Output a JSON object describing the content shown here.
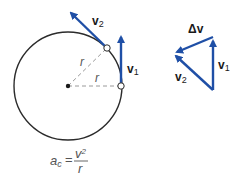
{
  "diagram": {
    "colors": {
      "vector": "#1f4fa6",
      "circle": "#2b2b2b",
      "radius_dash": "#9a9a9a",
      "label": "#1a1a1a",
      "formula": "#555555"
    },
    "circle": {
      "center": [
        68,
        86
      ],
      "radius": 54
    },
    "points": [
      {
        "name": "point-1",
        "pos": [
          121,
          86
        ]
      },
      {
        "name": "point-2",
        "pos": [
          107,
          48
        ]
      }
    ],
    "radius_labels": [
      "r",
      "r"
    ],
    "vectors_on_circle": [
      {
        "id": "v1",
        "label": "v",
        "subscript": "1",
        "from": [
          121,
          86
        ],
        "to": [
          121,
          33
        ]
      },
      {
        "id": "v2",
        "label": "v",
        "subscript": "2",
        "from": [
          107,
          48
        ],
        "to": [
          68,
          10
        ]
      }
    ],
    "vector_triangle": {
      "vertices": {
        "bottom": [
          213,
          90
        ],
        "top": [
          213,
          37
        ],
        "left": [
          173,
          53
        ]
      },
      "labels": {
        "v1": {
          "label": "v",
          "subscript": "1"
        },
        "v2": {
          "label": "v",
          "subscript": "2"
        },
        "delta_v": {
          "label": "Δv"
        }
      }
    },
    "formula": {
      "lhs": "a",
      "lhs_sub": "c",
      "equals": "=",
      "numerator": "v",
      "numerator_sup": "2",
      "denominator": "r"
    }
  }
}
